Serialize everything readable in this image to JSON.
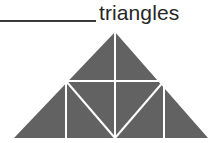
{
  "question": {
    "answer_blank": {
      "value": "",
      "placeholder": ""
    },
    "unit_label": "triangles"
  },
  "figure": {
    "name": "subdivided-triangle-figure",
    "fill_color": "#626262",
    "line_color": "#ffffff",
    "line_width": 2,
    "outer_triangle": {
      "apex": [
        115,
        32
      ],
      "base_left": [
        14,
        138
      ],
      "base_right": [
        208,
        138
      ]
    },
    "interior_points": {
      "left_mid": [
        66,
        81
      ],
      "right_mid": [
        164,
        81
      ],
      "base_center": [
        115,
        138
      ]
    },
    "segments": [
      {
        "name": "center-vertical",
        "from": [
          115,
          32
        ],
        "to": [
          115,
          138
        ]
      },
      {
        "name": "horizontal-midline",
        "from": [
          66,
          81
        ],
        "to": [
          164,
          81
        ]
      },
      {
        "name": "left-vertical",
        "from": [
          66,
          81
        ],
        "to": [
          66,
          138
        ]
      },
      {
        "name": "right-vertical",
        "from": [
          164,
          81
        ],
        "to": [
          164,
          138
        ]
      },
      {
        "name": "left-diagonal",
        "from": [
          66,
          81
        ],
        "to": [
          115,
          138
        ]
      },
      {
        "name": "right-diagonal",
        "from": [
          164,
          81
        ],
        "to": [
          115,
          138
        ]
      }
    ]
  }
}
